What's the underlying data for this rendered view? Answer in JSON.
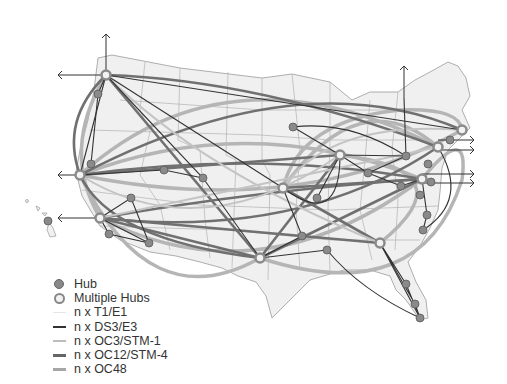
{
  "colors": {
    "t1": "#e6e6e6",
    "ds3": "#333333",
    "oc3": "#bdbdbd",
    "oc12": "#666666",
    "oc48": "#a6a6a6",
    "hub": "#8a8a8a",
    "land": "#f0f0f0",
    "border": "#9a9a9a"
  },
  "legend": {
    "items": [
      {
        "label": "Hub",
        "type": "hub"
      },
      {
        "label": "Multiple Hubs",
        "type": "multi-hub"
      },
      {
        "label": "n x T1/E1",
        "type": "line",
        "color": "#e6e6e6",
        "width": 1
      },
      {
        "label": "n x DS3/E3",
        "type": "line",
        "color": "#333333",
        "width": 2
      },
      {
        "label": "n x OC3/STM-1",
        "type": "line",
        "color": "#bdbdbd",
        "width": 2
      },
      {
        "label": "n x OC12/STM-4",
        "type": "line",
        "color": "#666666",
        "width": 3
      },
      {
        "label": "n x OC48",
        "type": "line",
        "color": "#a6a6a6",
        "width": 3.5
      }
    ]
  },
  "nodes": {
    "multi": [
      [
        106,
        75
      ],
      [
        80,
        175
      ],
      [
        100,
        218
      ],
      [
        283,
        188
      ],
      [
        260,
        258
      ],
      [
        380,
        243
      ],
      [
        340,
        155
      ],
      [
        422,
        179
      ],
      [
        438,
        147
      ],
      [
        462,
        130
      ]
    ],
    "hub": [
      [
        98,
        94
      ],
      [
        91,
        164
      ],
      [
        164,
        170
      ],
      [
        203,
        178
      ],
      [
        131,
        198
      ],
      [
        109,
        234
      ],
      [
        149,
        243
      ],
      [
        293,
        127
      ],
      [
        368,
        173
      ],
      [
        401,
        186
      ],
      [
        406,
        156
      ],
      [
        317,
        198
      ],
      [
        302,
        236
      ],
      [
        328,
        284
      ],
      [
        428,
        164
      ],
      [
        431,
        182
      ],
      [
        420,
        195
      ],
      [
        450,
        140
      ],
      [
        427,
        215
      ],
      [
        423,
        230
      ],
      [
        406,
        284
      ],
      [
        415,
        304
      ],
      [
        420,
        318
      ],
      [
        327,
        250
      ]
    ]
  }
}
